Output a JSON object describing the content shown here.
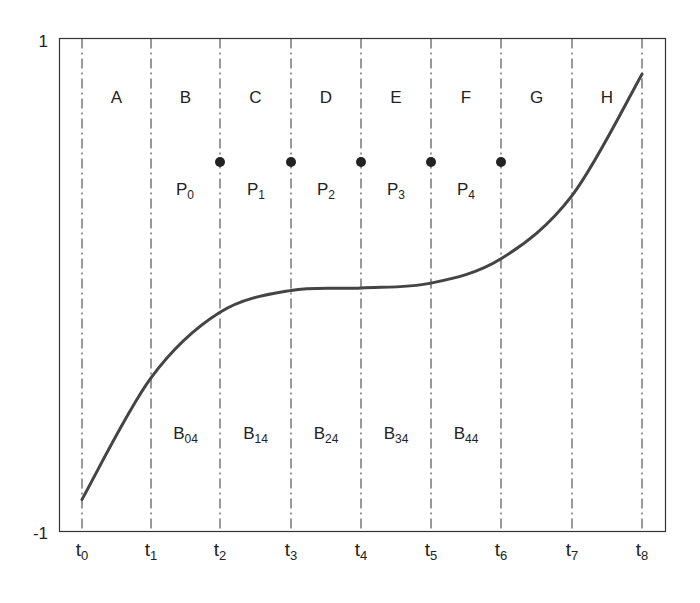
{
  "chart_data": {
    "type": "line",
    "title": "",
    "xlabel": "",
    "ylabel": "",
    "ylim": [
      -1,
      1
    ],
    "y_ticks": [
      "1",
      "-1"
    ],
    "x_ticks": [
      "t0",
      "t1",
      "t2",
      "t3",
      "t4",
      "t5",
      "t6",
      "t7",
      "t8"
    ],
    "x_tick_labels": [
      {
        "base": "t",
        "sub": "0"
      },
      {
        "base": "t",
        "sub": "1"
      },
      {
        "base": "t",
        "sub": "2"
      },
      {
        "base": "t",
        "sub": "3"
      },
      {
        "base": "t",
        "sub": "4"
      },
      {
        "base": "t",
        "sub": "5"
      },
      {
        "base": "t",
        "sub": "6"
      },
      {
        "base": "t",
        "sub": "7"
      },
      {
        "base": "t",
        "sub": "8"
      }
    ],
    "interval_labels": [
      "A",
      "B",
      "C",
      "D",
      "E",
      "F",
      "G",
      "H"
    ],
    "control_points": [
      {
        "base": "P",
        "sub": "0",
        "at": "t2"
      },
      {
        "base": "P",
        "sub": "1",
        "at": "t3"
      },
      {
        "base": "P",
        "sub": "2",
        "at": "t4"
      },
      {
        "base": "P",
        "sub": "3",
        "at": "t5"
      },
      {
        "base": "P",
        "sub": "4",
        "at": "t6"
      }
    ],
    "control_point_y": 0.58,
    "basis_labels": [
      {
        "base": "B",
        "sub": "04"
      },
      {
        "base": "B",
        "sub": "14"
      },
      {
        "base": "B",
        "sub": "24"
      },
      {
        "base": "B",
        "sub": "34"
      },
      {
        "base": "B",
        "sub": "44"
      }
    ],
    "series": [
      {
        "name": "curve",
        "x": [
          "t0",
          "t1",
          "t2",
          "t3",
          "t4",
          "t5",
          "t6",
          "t7",
          "t8"
        ],
        "values": [
          -0.87,
          -0.37,
          -0.1,
          -0.01,
          0.0,
          0.02,
          0.12,
          0.38,
          0.88
        ]
      }
    ],
    "grid": "vertical dash-dot lines at each t_i",
    "legend": "none"
  },
  "colors": {
    "axis": "#333333",
    "curve": "#444444",
    "grid": "#333333",
    "point": "#222222"
  }
}
